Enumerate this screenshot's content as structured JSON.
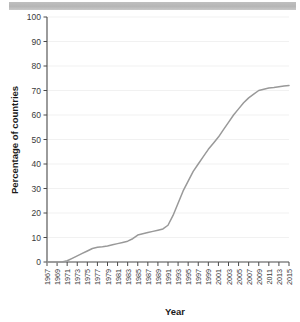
{
  "window": {
    "titlebar_name": "scroll-bar"
  },
  "chart_data": {
    "type": "line",
    "title": "",
    "xlabel": "Year",
    "ylabel": "Percentage of countries",
    "xlim": [
      1967,
      2015
    ],
    "ylim": [
      0,
      100
    ],
    "grid": true,
    "legend": null,
    "ytick_labels": [
      "0",
      "10",
      "20",
      "30",
      "40",
      "50",
      "60",
      "70",
      "80",
      "90",
      "100"
    ],
    "ytick_values": [
      0,
      10,
      20,
      30,
      40,
      50,
      60,
      70,
      80,
      90,
      100
    ],
    "xtick_labels": [
      "1967",
      "1969",
      "1971",
      "1973",
      "1975",
      "1977",
      "1979",
      "1981",
      "1983",
      "1985",
      "1987",
      "1989",
      "1991",
      "1993",
      "1995",
      "1997",
      "1999",
      "2001",
      "2003",
      "2005",
      "2007",
      "2009",
      "2011",
      "2013",
      "2015"
    ],
    "xtick_values": [
      1967,
      1969,
      1971,
      1973,
      1975,
      1977,
      1979,
      1981,
      1983,
      1985,
      1987,
      1989,
      1991,
      1993,
      1995,
      1997,
      1999,
      2001,
      2003,
      2005,
      2007,
      2009,
      2011,
      2013,
      2015
    ],
    "series": [
      {
        "name": "Percentage of countries",
        "color": "#999999",
        "x": [
          1967,
          1968,
          1969,
          1970,
          1971,
          1972,
          1973,
          1974,
          1975,
          1976,
          1977,
          1978,
          1979,
          1980,
          1981,
          1982,
          1983,
          1984,
          1985,
          1986,
          1987,
          1988,
          1989,
          1990,
          1991,
          1992,
          1993,
          1994,
          1995,
          1996,
          1997,
          1998,
          1999,
          2000,
          2001,
          2002,
          2003,
          2004,
          2005,
          2006,
          2007,
          2008,
          2009,
          2010,
          2011,
          2012,
          2013,
          2014,
          2015
        ],
        "y": [
          0,
          0,
          0,
          0,
          0.5,
          1.5,
          2.5,
          3.5,
          4.5,
          5.5,
          6,
          6.2,
          6.5,
          7,
          7.5,
          8,
          8.5,
          9.5,
          11,
          11.5,
          12,
          12.5,
          13,
          13.5,
          15,
          19,
          24,
          29,
          33,
          37,
          40,
          43,
          46,
          48.5,
          51,
          54,
          57,
          60,
          62.5,
          65,
          67,
          68.5,
          70,
          70.5,
          71,
          71.2,
          71.5,
          71.8,
          72
        ]
      }
    ]
  }
}
